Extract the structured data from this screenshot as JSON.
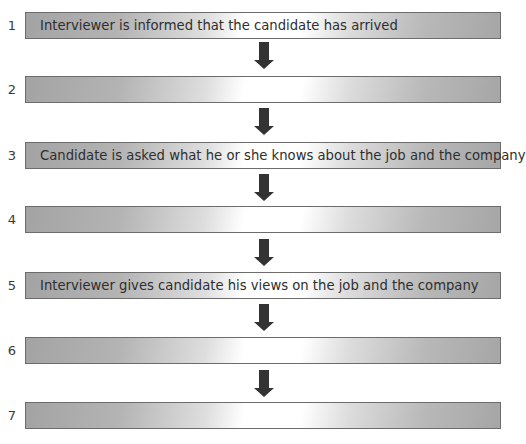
{
  "diagram": {
    "type": "flowchart",
    "orientation": "vertical",
    "colors": {
      "box_border": "#6c6c6c",
      "box_fill_dark": "#a3a3a3",
      "box_fill_light": "#ffffff",
      "arrow": "#333333",
      "text": "#2e2e2e"
    },
    "steps": [
      {
        "number": "1",
        "text": "Interviewer is informed that the candidate has arrived"
      },
      {
        "number": "2",
        "text": ""
      },
      {
        "number": "3",
        "text": "Candidate is asked what he or she knows about the job and the company"
      },
      {
        "number": "4",
        "text": ""
      },
      {
        "number": "5",
        "text": "Interviewer gives candidate his views on the job and the company"
      },
      {
        "number": "6",
        "text": ""
      },
      {
        "number": "7",
        "text": ""
      }
    ],
    "arrows": [
      {
        "from": "1",
        "to": "2",
        "icon": "down-arrow-icon"
      },
      {
        "from": "2",
        "to": "3",
        "icon": "down-arrow-icon"
      },
      {
        "from": "3",
        "to": "4",
        "icon": "down-arrow-icon"
      },
      {
        "from": "4",
        "to": "5",
        "icon": "down-arrow-icon"
      },
      {
        "from": "5",
        "to": "6",
        "icon": "down-arrow-icon"
      },
      {
        "from": "6",
        "to": "7",
        "icon": "down-arrow-icon"
      }
    ]
  }
}
